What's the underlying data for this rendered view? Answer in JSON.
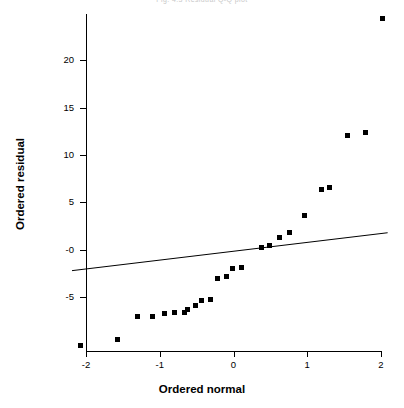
{
  "title": "Fig. 4.3  Residual Q-Q plot",
  "chart_data": {
    "type": "scatter",
    "title": "Fig. 4.3  Residual Q-Q plot",
    "xlabel": "Ordered normal",
    "ylabel": "Ordered residual",
    "xlim": [
      -2.19,
      2.11
    ],
    "ylim": [
      -10.8,
      25.2
    ],
    "xticks": [
      -2,
      -1,
      0,
      1,
      2
    ],
    "xticklabels": [
      "-2",
      "-1",
      "0",
      "1",
      "2"
    ],
    "yticks": [
      -5,
      0,
      5,
      10,
      15,
      20
    ],
    "yticklabels": [
      "-5",
      "-0",
      "5",
      "10",
      "15",
      "20"
    ],
    "grid": false,
    "legend": null,
    "marker": "filled-square",
    "series": [
      {
        "name": "Ordered residual vs ordered normal",
        "points": [
          [
            -2.07,
            -10.1
          ],
          [
            -1.57,
            -9.5
          ],
          [
            -1.29,
            -7.1
          ],
          [
            -1.09,
            -7.1
          ],
          [
            -0.93,
            -6.8
          ],
          [
            -0.79,
            -6.7
          ],
          [
            -0.66,
            -6.7
          ],
          [
            -0.62,
            -6.4
          ],
          [
            -0.51,
            -5.9
          ],
          [
            -0.43,
            -5.4
          ],
          [
            -0.3,
            -5.3
          ],
          [
            -0.21,
            -3.1
          ],
          [
            -0.09,
            -2.9
          ],
          [
            -0.01,
            -2.0
          ],
          [
            0.12,
            -1.9
          ],
          [
            0.39,
            0.2
          ],
          [
            0.5,
            0.4
          ],
          [
            0.63,
            1.2
          ],
          [
            0.77,
            1.8
          ],
          [
            0.97,
            3.6
          ],
          [
            1.2,
            6.3
          ],
          [
            1.31,
            6.5
          ],
          [
            1.55,
            12.0
          ],
          [
            1.8,
            12.3
          ],
          [
            2.03,
            24.3
          ]
        ]
      }
    ],
    "reference_line": {
      "name": "fitted reference line",
      "x": [
        -2.19,
        2.09
      ],
      "y": [
        -2.2,
        1.8
      ]
    }
  }
}
